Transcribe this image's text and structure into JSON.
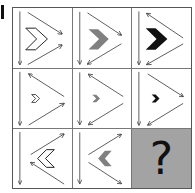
{
  "puzzle": {
    "type": "3x3 matrix reasoning",
    "question_mark": "?",
    "colors": {
      "outline": "#222222",
      "gray_fill": "#808080",
      "black_fill": "#111111",
      "question_bg": "#a3a3a3",
      "arrow": "#333333"
    },
    "cells": [
      {
        "row": 1,
        "col": 1,
        "chevron_dir": "right",
        "chevron_size": "large",
        "chevron_style": "outline",
        "arrows": "converge-right"
      },
      {
        "row": 1,
        "col": 2,
        "chevron_dir": "right",
        "chevron_size": "large",
        "chevron_style": "gray",
        "arrows": "upper-right-lower-left"
      },
      {
        "row": 1,
        "col": 3,
        "chevron_dir": "right",
        "chevron_size": "large",
        "chevron_style": "black",
        "arrows": "both-left"
      },
      {
        "row": 2,
        "col": 1,
        "chevron_dir": "right",
        "chevron_size": "small",
        "chevron_style": "outline",
        "arrows": "upper-left-lower-right"
      },
      {
        "row": 2,
        "col": 2,
        "chevron_dir": "right",
        "chevron_size": "small",
        "chevron_style": "gray",
        "arrows": "both-left"
      },
      {
        "row": 2,
        "col": 3,
        "chevron_dir": "right",
        "chevron_size": "small",
        "chevron_style": "black",
        "arrows": "upper-right-lower-left"
      },
      {
        "row": 3,
        "col": 1,
        "chevron_dir": "left",
        "chevron_size": "medium",
        "chevron_style": "outline",
        "arrows": "upper-right-lower-left-tip"
      },
      {
        "row": 3,
        "col": 2,
        "chevron_dir": "left",
        "chevron_size": "medium",
        "chevron_style": "gray",
        "arrows": "both-right"
      },
      {
        "row": 3,
        "col": 3,
        "unknown": true
      }
    ]
  }
}
